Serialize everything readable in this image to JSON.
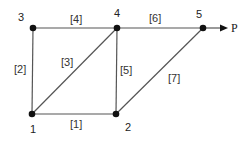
{
  "diagram": {
    "type": "truss",
    "nodes": [
      {
        "id": "1",
        "x": 32,
        "y": 114,
        "label_x": 30,
        "label_y": 133
      },
      {
        "id": "2",
        "x": 116,
        "y": 114,
        "label_x": 125,
        "label_y": 131
      },
      {
        "id": "3",
        "x": 33,
        "y": 28,
        "label_x": 18,
        "label_y": 21
      },
      {
        "id": "4",
        "x": 117,
        "y": 28,
        "label_x": 114,
        "label_y": 17
      },
      {
        "id": "5",
        "x": 203,
        "y": 28,
        "label_x": 196,
        "label_y": 18
      }
    ],
    "members": [
      {
        "label": "[1]",
        "from": "1",
        "to": "2",
        "label_x": 70,
        "label_y": 128
      },
      {
        "label": "[2]",
        "from": "1",
        "to": "3",
        "label_x": 14,
        "label_y": 73
      },
      {
        "label": "[3]",
        "from": "1",
        "to": "4",
        "label_x": 61,
        "label_y": 66
      },
      {
        "label": "[4]",
        "from": "3",
        "to": "4",
        "label_x": 70,
        "label_y": 23
      },
      {
        "label": "[5]",
        "from": "2",
        "to": "4",
        "label_x": 120,
        "label_y": 74
      },
      {
        "label": "[6]",
        "from": "4",
        "to": "5",
        "label_x": 149,
        "label_y": 22
      },
      {
        "label": "[7]",
        "from": "2",
        "to": "5",
        "label_x": 168,
        "label_y": 82
      }
    ],
    "load": {
      "label": "P",
      "node": "5",
      "direction": "right",
      "arrow_end_x": 228,
      "label_x": 231,
      "label_y": 32
    },
    "colors": {
      "line": "#555555",
      "node": "#111111",
      "text": "#333333"
    }
  }
}
